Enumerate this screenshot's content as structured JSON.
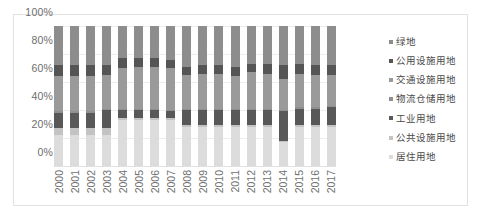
{
  "chart_data": {
    "type": "bar",
    "stacked": true,
    "normalized_percent": true,
    "title": "",
    "subtitle": "",
    "xlabel": "",
    "ylabel": "",
    "ylim": [
      0,
      100
    ],
    "ytick_labels": [
      "0%",
      "20%",
      "40%",
      "60%",
      "80%",
      "100%"
    ],
    "ytick_values": [
      0,
      20,
      40,
      60,
      80,
      100
    ],
    "grid": true,
    "legend_position": "right",
    "categories": [
      "2000",
      "2001",
      "2002",
      "2003",
      "2004",
      "2005",
      "2006",
      "2007",
      "2008",
      "2009",
      "2010",
      "2011",
      "2012",
      "2013",
      "2014",
      "2015",
      "2016",
      "2017"
    ],
    "series": [
      {
        "name": "居住用地",
        "color": "#dcdcdc",
        "values": [
          22,
          22,
          22,
          22,
          33,
          33,
          33,
          33,
          28,
          28,
          28,
          28,
          28,
          28,
          17,
          28,
          28,
          28
        ]
      },
      {
        "name": "公共设施用地",
        "color": "#c3c3c3",
        "values": [
          5,
          5,
          5,
          5,
          1,
          1,
          1,
          1,
          1,
          1,
          1,
          1,
          1,
          1,
          1,
          1,
          1,
          1
        ]
      },
      {
        "name": "工业用地",
        "color": "#585858",
        "values": [
          11,
          11,
          11,
          13,
          6,
          6,
          6,
          5,
          11,
          11,
          11,
          11,
          11,
          11,
          21,
          12,
          12,
          13
        ]
      },
      {
        "name": "物流仓储用地",
        "color": "#8f8f8f",
        "values": [
          1,
          1,
          1,
          1,
          1,
          1,
          1,
          1,
          1,
          1,
          1,
          1,
          1,
          1,
          1,
          1,
          1,
          1
        ]
      },
      {
        "name": "交通设施用地",
        "color": "#9a9a9a",
        "values": [
          25,
          25,
          25,
          24,
          29,
          30,
          30,
          30,
          24,
          25,
          25,
          23,
          26,
          25,
          22,
          24,
          23,
          22
        ]
      },
      {
        "name": "公用设施用地",
        "color": "#555555",
        "values": [
          8,
          8,
          8,
          7,
          7,
          6,
          6,
          6,
          6,
          6,
          6,
          7,
          6,
          7,
          10,
          7,
          7,
          7
        ]
      },
      {
        "name": "绿地",
        "color": "#8d8d8d",
        "values": [
          28,
          28,
          28,
          28,
          23,
          23,
          23,
          24,
          29,
          28,
          28,
          29,
          27,
          27,
          28,
          27,
          28,
          28
        ]
      }
    ]
  },
  "legend": {
    "items": [
      {
        "label": "绿地",
        "color": "#8d8d8d"
      },
      {
        "label": "公用设施用地",
        "color": "#555555"
      },
      {
        "label": "交通设施用地",
        "color": "#9a9a9a"
      },
      {
        "label": "物流仓储用地",
        "color": "#8f8f8f"
      },
      {
        "label": "工业用地",
        "color": "#585858"
      },
      {
        "label": "公共设施用地",
        "color": "#c3c3c3"
      },
      {
        "label": "居住用地",
        "color": "#dcdcdc"
      }
    ]
  }
}
